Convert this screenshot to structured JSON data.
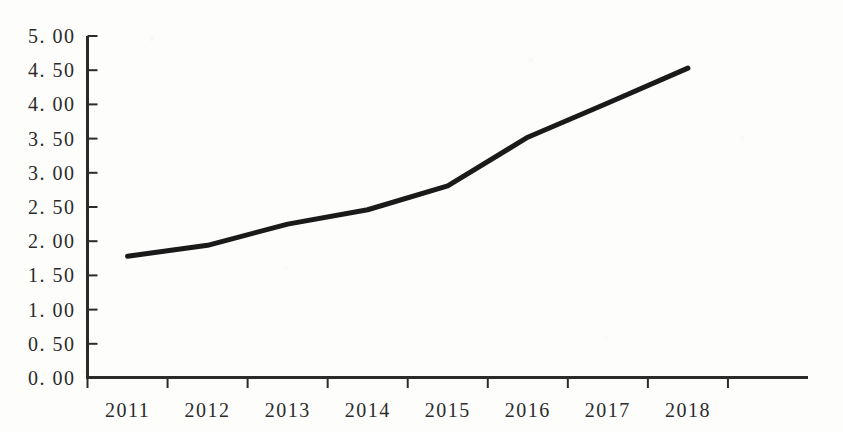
{
  "chart_data": {
    "type": "line",
    "title": "",
    "subtitle": "",
    "xlabel": "",
    "ylabel": "",
    "categories": [
      "2011",
      "2012",
      "2013",
      "2014",
      "2015",
      "2016",
      "2017",
      "2018"
    ],
    "values": [
      1.78,
      1.94,
      2.25,
      2.46,
      2.81,
      3.52,
      4.02,
      4.53
    ],
    "series": [
      {
        "name": "",
        "values": [
          1.78,
          1.94,
          2.25,
          2.46,
          2.81,
          3.52,
          4.02,
          4.53
        ]
      }
    ],
    "ylim": [
      0.0,
      5.0
    ],
    "ytick_values": [
      0.0,
      0.5,
      1.0,
      1.5,
      2.0,
      2.5,
      3.0,
      3.5,
      4.0,
      4.5,
      5.0
    ],
    "ytick_labels": [
      "0. 00",
      "0. 50",
      "1. 00",
      "1. 50",
      "2. 00",
      "2. 50",
      "3. 00",
      "3. 50",
      "4. 00",
      "4. 50",
      "5. 00"
    ],
    "xtick_labels": [
      "2011",
      "2012",
      "2013",
      "2014",
      "2015",
      "2016",
      "2017",
      "2018"
    ],
    "grid": false,
    "legend": false,
    "legend_position": "none",
    "line_color": "#1a1a1a",
    "line_width": 5,
    "markers": false,
    "axis_color": "#2b2b2b",
    "background_color": "#fdfdfc"
  },
  "axes": {
    "y_axis_name": "value-axis",
    "x_axis_name": "year-axis",
    "y_tick_direction": "inward",
    "x_tick_direction": "outward"
  }
}
